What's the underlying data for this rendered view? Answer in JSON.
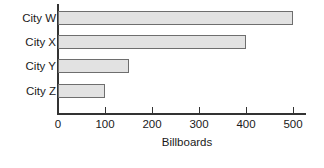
{
  "chart_data": {
    "type": "bar",
    "orientation": "horizontal",
    "title": "",
    "xlabel": "Billboards",
    "ylabel": "",
    "categories": [
      "City W",
      "City X",
      "City Y",
      "City Z"
    ],
    "values": [
      500,
      400,
      150,
      100
    ],
    "xlim": [
      0,
      500
    ],
    "xticks": [
      0,
      100,
      200,
      300,
      400,
      500
    ],
    "xtick_labels": [
      "0",
      "100",
      "200",
      "300",
      "400",
      "500"
    ],
    "grid": false,
    "legend": null,
    "series": [
      {
        "name": "Billboards",
        "values": [
          500,
          400,
          150,
          100
        ]
      }
    ],
    "colors": {
      "bar_fill": "#e2e2e2",
      "bar_border": "#6e6e6e",
      "axis": "#333333",
      "text": "#1a1a1a",
      "background": "#ffffff"
    }
  }
}
